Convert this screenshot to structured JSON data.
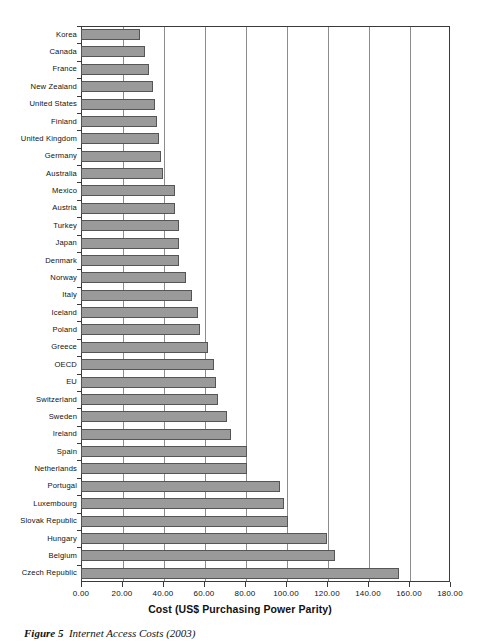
{
  "figure": {
    "caption_label": "Figure 5",
    "caption_text": "Internet Access Costs (2003)"
  },
  "axis": {
    "x_title": "Cost (US$ Purchasing Power Parity)",
    "x_ticklabels": [
      "0.00",
      "20.00",
      "40.00",
      "60.00",
      "80.00",
      "100.00",
      "120.00",
      "140.00",
      "160.00",
      "180.00"
    ]
  },
  "style": {
    "bar_fill": "#9a9a9a",
    "bar_stroke": "#555555",
    "gridline_color": "#8c8c8c",
    "frame_color": "#3a3a3a",
    "background": "#ffffff"
  },
  "chart_data": {
    "type": "bar",
    "orientation": "horizontal",
    "title": "Internet Access Costs (2003)",
    "xlabel": "Cost (US$ Purchasing Power Parity)",
    "ylabel": "",
    "xlim": [
      0,
      180
    ],
    "xticks": [
      0,
      20,
      40,
      60,
      80,
      100,
      120,
      140,
      160,
      180
    ],
    "grid": true,
    "legend": false,
    "categories": [
      "Korea",
      "Canada",
      "France",
      "New Zealand",
      "United States",
      "Finland",
      "United Kingdom",
      "Germany",
      "Australia",
      "Mexico",
      "Austria",
      "Turkey",
      "Japan",
      "Denmark",
      "Norway",
      "Italy",
      "Iceland",
      "Poland",
      "Greece",
      "OECD",
      "EU",
      "Switzerland",
      "Sweden",
      "Ireland",
      "Spain",
      "Netherlands",
      "Portugal",
      "Luxembourg",
      "Slovak Republic",
      "Hungary",
      "Belgium",
      "Czech Republic"
    ],
    "values": [
      29,
      31,
      33,
      35,
      36,
      37,
      38,
      39,
      40,
      46,
      46,
      48,
      48,
      48,
      51,
      54,
      57,
      58,
      62,
      65,
      66,
      67,
      71,
      73,
      81,
      81,
      97,
      99,
      101,
      120,
      124,
      155
    ]
  }
}
